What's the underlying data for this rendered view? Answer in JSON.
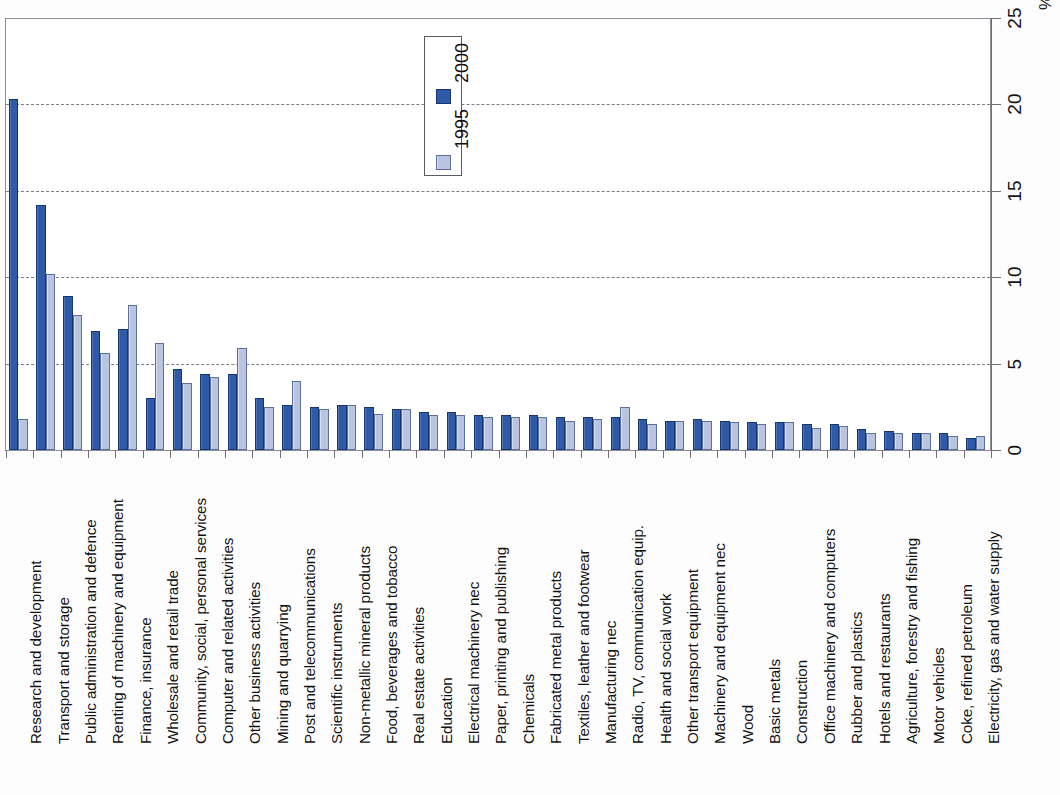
{
  "chart_data": {
    "type": "bar",
    "title": "",
    "subtitle": "",
    "xlabel": "",
    "ylabel": "%",
    "ylim": [
      0,
      25
    ],
    "yticks": [
      0,
      5,
      10,
      15,
      20,
      25
    ],
    "ytick_labels": [
      "0",
      "5",
      "10",
      "15",
      "20",
      "25"
    ],
    "unit_symbol": "%",
    "grid": true,
    "grid_axis": "y",
    "orientation": "vertical",
    "legend_position": "top-center",
    "legend_entries": [
      "2000",
      "1995"
    ],
    "colors": {
      "series_2000": "#2f5aa8",
      "series_2000_edge": "#17356e",
      "series_1995": "#b9c4e0",
      "series_1995_edge": "#5d6f9c",
      "gridline": "#7c7c86",
      "axis": "#6f6f78",
      "background": "#ffffff"
    },
    "categories": [
      "Research and development",
      "Transport and storage",
      "Public administration and defence",
      "Renting of machinery and equipment",
      "Finance, insurance",
      "Wholesale and retail trade",
      "Community, social, personal services",
      "Computer and related activities",
      "Other business activities",
      "Mining and quarrying",
      "Post and telecommunications",
      "Scientific instruments",
      "Non-metallic mineral products",
      "Food, beverages and tobacco",
      "Real estate activities",
      "Education",
      "Electrical machinery nec",
      "Paper, printing and publishing",
      "Chemicals",
      "Fabricated metal products",
      "Textiles, leather and footwear",
      "Manufacturing nec",
      "Radio, TV, communication equip.",
      "Health and social work",
      "Other transport equipment",
      "Machinery and equipment nec",
      "Wood",
      "Basic metals",
      "Construction",
      "Office machinery and computers",
      "Rubber and plastics",
      "Hotels and restaurants",
      "Agriculture, forestry and fishing",
      "Motor vehicles",
      "Coke, refined petroleum",
      "Electricity, gas and water supply"
    ],
    "series": [
      {
        "name": "2000",
        "values": [
          20.3,
          14.2,
          8.9,
          6.9,
          7.0,
          3.0,
          4.7,
          4.4,
          4.4,
          3.0,
          2.6,
          2.5,
          2.6,
          2.5,
          2.4,
          2.2,
          2.2,
          2.0,
          2.0,
          2.0,
          1.9,
          1.9,
          1.9,
          1.8,
          1.7,
          1.8,
          1.7,
          1.6,
          1.6,
          1.5,
          1.5,
          1.2,
          1.1,
          1.0,
          1.0,
          0.7
        ]
      },
      {
        "name": "1995",
        "values": [
          1.8,
          10.2,
          7.8,
          5.6,
          8.4,
          6.2,
          3.9,
          4.2,
          5.9,
          2.5,
          4.0,
          2.4,
          2.6,
          2.1,
          2.4,
          2.0,
          2.0,
          1.9,
          1.9,
          1.9,
          1.7,
          1.8,
          2.5,
          1.5,
          1.7,
          1.7,
          1.6,
          1.5,
          1.6,
          1.3,
          1.4,
          1.0,
          1.0,
          1.0,
          0.8,
          0.8
        ]
      }
    ]
  },
  "legend": {
    "box_label": "series-legend",
    "entries": [
      {
        "label": "2000",
        "swatch": "dark"
      },
      {
        "label": "1995",
        "swatch": "light"
      }
    ]
  },
  "axis": {
    "percent_symbol": "%"
  }
}
